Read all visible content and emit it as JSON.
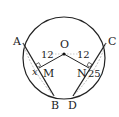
{
  "diagram": {
    "type": "circle-geometry",
    "center_label": "O",
    "points": {
      "A": "A",
      "B": "B",
      "C": "C",
      "D": "D",
      "M": "M",
      "N": "N"
    },
    "segment_labels": {
      "OM": "12",
      "ON": "12",
      "AM": "x",
      "NC": "25"
    },
    "colors": {
      "stroke": "#222222",
      "dashed": "#999999",
      "background": "#ffffff"
    }
  }
}
